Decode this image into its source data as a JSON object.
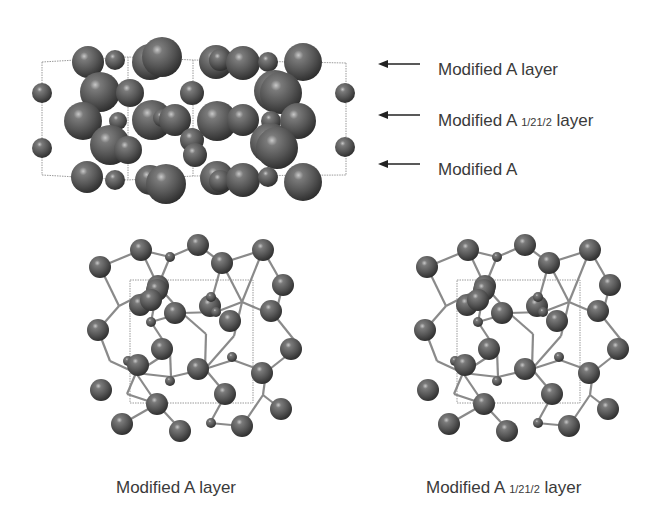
{
  "colors": {
    "atom": "#555555",
    "atom_highlight": "#bdbdbd",
    "atom_shadow": "#2a2a2a",
    "bond": "#8a8a8a",
    "cell": "#9a9a9a",
    "text": "#3a3a3a",
    "arrow": "#222222"
  },
  "side_view": {
    "cell": {
      "top": [
        [
          42,
          62
        ],
        [
          128,
          57
        ],
        [
          193,
          60
        ],
        [
          346,
          63
        ]
      ],
      "bottom": [
        [
          42,
          175
        ],
        [
          128,
          180
        ],
        [
          193,
          176
        ],
        [
          346,
          175
        ]
      ]
    },
    "atoms": [
      [
        88,
        62,
        16
      ],
      [
        115,
        60,
        10
      ],
      [
        150,
        62,
        18
      ],
      [
        162,
        57,
        20
      ],
      [
        216,
        62,
        17
      ],
      [
        220,
        60,
        11
      ],
      [
        243,
        63,
        17
      ],
      [
        268,
        62,
        10
      ],
      [
        303,
        62,
        19
      ],
      [
        42,
        93,
        10
      ],
      [
        192,
        93,
        12
      ],
      [
        275,
        91,
        21
      ],
      [
        281,
        93,
        21
      ],
      [
        345,
        93,
        10
      ],
      [
        100,
        92,
        20
      ],
      [
        130,
        93,
        14
      ],
      [
        83,
        121,
        19
      ],
      [
        118,
        121,
        9
      ],
      [
        152,
        120,
        20
      ],
      [
        162,
        118,
        9
      ],
      [
        175,
        120,
        16
      ],
      [
        217,
        121,
        20
      ],
      [
        243,
        120,
        16
      ],
      [
        271,
        121,
        10
      ],
      [
        298,
        121,
        18
      ],
      [
        42,
        148,
        10
      ],
      [
        110,
        145,
        20
      ],
      [
        128,
        150,
        14
      ],
      [
        192,
        140,
        12
      ],
      [
        195,
        155,
        12
      ],
      [
        270,
        143,
        20
      ],
      [
        277,
        148,
        21
      ],
      [
        345,
        147,
        10
      ],
      [
        87,
        177,
        16
      ],
      [
        115,
        180,
        10
      ],
      [
        150,
        180,
        15
      ],
      [
        166,
        184,
        20
      ],
      [
        217,
        178,
        17
      ],
      [
        220,
        181,
        11
      ],
      [
        243,
        180,
        17
      ],
      [
        268,
        177,
        10
      ],
      [
        303,
        182,
        19
      ]
    ]
  },
  "top_views": [
    {
      "id": "modified-a-layer",
      "cell": [
        130,
        280,
        253,
        403
      ],
      "atoms": [
        [
          100,
          267,
          11,
          "L"
        ],
        [
          141,
          250,
          11,
          "L"
        ],
        [
          170,
          257,
          5,
          "S"
        ],
        [
          198,
          245,
          11,
          "L"
        ],
        [
          222,
          263,
          11,
          "L"
        ],
        [
          263,
          250,
          11,
          "L"
        ],
        [
          283,
          285,
          11,
          "L"
        ],
        [
          158,
          286,
          11,
          "L"
        ],
        [
          157,
          281,
          0,
          "N"
        ],
        [
          157,
          290,
          11,
          "L"
        ],
        [
          210,
          306,
          11,
          "L"
        ],
        [
          140,
          305,
          11,
          "L"
        ],
        [
          271,
          311,
          11,
          "L"
        ],
        [
          151,
          300,
          0,
          "N"
        ],
        [
          151,
          300,
          11,
          "L"
        ],
        [
          175,
          313,
          11,
          "L"
        ],
        [
          211,
          297,
          5,
          "S"
        ],
        [
          230,
          321,
          11,
          "L"
        ],
        [
          256,
          320,
          0,
          "N"
        ],
        [
          98,
          330,
          11,
          "L"
        ],
        [
          291,
          349,
          11,
          "L"
        ],
        [
          162,
          349,
          11,
          "L"
        ],
        [
          211,
          300,
          0,
          "N"
        ],
        [
          128,
          361,
          5,
          "S"
        ],
        [
          232,
          357,
          5,
          "S"
        ],
        [
          138,
          365,
          11,
          "L"
        ],
        [
          198,
          369,
          11,
          "L"
        ],
        [
          262,
          373,
          11,
          "L"
        ],
        [
          170,
          381,
          5,
          "S"
        ],
        [
          101,
          390,
          11,
          "L"
        ],
        [
          225,
          394,
          11,
          "L"
        ],
        [
          157,
          404,
          11,
          "L"
        ],
        [
          281,
          409,
          11,
          "L"
        ],
        [
          122,
          424,
          11,
          "L"
        ],
        [
          211,
          423,
          5,
          "S"
        ],
        [
          242,
          426,
          11,
          "L"
        ],
        [
          180,
          431,
          11,
          "L"
        ],
        [
          183,
          427,
          0,
          "N"
        ],
        [
          216,
          312,
          5,
          "S"
        ],
        [
          151,
          322,
          5,
          "S"
        ]
      ],
      "bonds": [
        [
          100,
          267,
          141,
          250
        ],
        [
          141,
          250,
          170,
          257
        ],
        [
          170,
          257,
          198,
          245
        ],
        [
          198,
          245,
          222,
          263
        ],
        [
          222,
          263,
          263,
          250
        ],
        [
          263,
          250,
          283,
          285
        ],
        [
          141,
          250,
          158,
          286
        ],
        [
          170,
          257,
          158,
          286
        ],
        [
          158,
          286,
          119,
          306
        ],
        [
          158,
          286,
          151,
          322
        ],
        [
          158,
          286,
          182,
          313
        ],
        [
          222,
          263,
          210,
          306
        ],
        [
          210,
          306,
          211,
          297
        ],
        [
          222,
          263,
          242,
          302
        ],
        [
          263,
          250,
          242,
          302
        ],
        [
          283,
          285,
          275,
          316
        ],
        [
          242,
          302,
          275,
          316
        ],
        [
          182,
          313,
          151,
          322
        ],
        [
          182,
          313,
          216,
          312
        ],
        [
          216,
          312,
          242,
          302
        ],
        [
          182,
          313,
          206,
          334
        ],
        [
          242,
          302,
          234,
          336
        ],
        [
          275,
          316,
          299,
          346
        ],
        [
          98,
          330,
          110,
          361
        ],
        [
          110,
          361,
          136,
          373
        ],
        [
          136,
          373,
          171,
          377
        ],
        [
          171,
          377,
          205,
          369
        ],
        [
          205,
          369,
          234,
          336
        ],
        [
          206,
          334,
          205,
          369
        ],
        [
          151,
          322,
          170,
          351
        ],
        [
          170,
          351,
          136,
          373
        ],
        [
          170,
          351,
          171,
          377
        ],
        [
          205,
          369,
          233,
          360
        ],
        [
          233,
          360,
          266,
          372
        ],
        [
          299,
          346,
          266,
          372
        ],
        [
          266,
          372,
          263,
          395
        ],
        [
          136,
          373,
          127,
          394
        ],
        [
          127,
          394,
          157,
          404
        ],
        [
          136,
          373,
          157,
          404
        ],
        [
          157,
          404,
          182,
          431
        ],
        [
          205,
          369,
          226,
          394
        ],
        [
          226,
          394,
          210,
          423
        ],
        [
          210,
          423,
          242,
          426
        ],
        [
          242,
          426,
          263,
          395
        ],
        [
          263,
          395,
          281,
          409
        ],
        [
          157,
          404,
          122,
          424
        ],
        [
          100,
          267,
          119,
          306
        ],
        [
          119,
          306,
          98,
          330
        ]
      ]
    }
  ],
  "side_labels": [
    {
      "text": "Modified A layer",
      "sub": "",
      "suffix": "",
      "x": 438,
      "y": 60
    },
    {
      "text": "Modified A ",
      "sub": "1/21/2",
      "suffix": " layer",
      "x": 438,
      "y": 111
    },
    {
      "text": "Modified A",
      "sub": "",
      "suffix": "",
      "x": 438,
      "y": 160
    }
  ],
  "arrows": [
    {
      "x": 378,
      "y": 64
    },
    {
      "x": 378,
      "y": 115
    },
    {
      "x": 378,
      "y": 164
    }
  ],
  "captions": [
    {
      "text": "Modified A layer",
      "sub": "",
      "suffix": "",
      "x": 116,
      "y": 478
    },
    {
      "text": "Modified A ",
      "sub": "1/21/2",
      "suffix": " layer",
      "x": 426,
      "y": 478
    }
  ]
}
